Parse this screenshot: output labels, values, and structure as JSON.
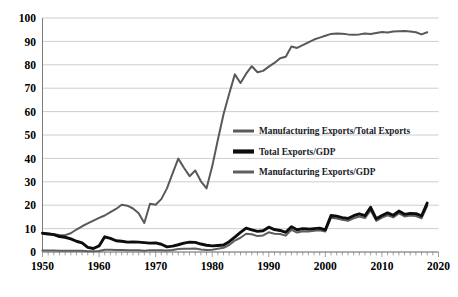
{
  "chart_data": {
    "type": "line",
    "title": "",
    "subtitle": "",
    "xlabel": "",
    "ylabel": "",
    "xlim": [
      1950,
      2020
    ],
    "ylim": [
      0,
      100
    ],
    "grid": true,
    "legend_position": "center-right-inside",
    "y_ticks": [
      0,
      10,
      20,
      30,
      40,
      50,
      60,
      70,
      80,
      90,
      100
    ],
    "y_tick_labels": [
      "0",
      "10",
      "20",
      "30",
      "40",
      "50",
      "60",
      "70",
      "80",
      "90",
      "100"
    ],
    "x_ticks": [
      1950,
      1960,
      1970,
      1980,
      1990,
      2000,
      2010,
      2020
    ],
    "x_tick_labels": [
      "1950",
      "1960",
      "1970",
      "1980",
      "1990",
      "2000",
      "2010",
      "2020"
    ],
    "x_minor_tick_step": 1,
    "colors": {
      "manufacturing_exports_total_exports": "#595959",
      "total_exports_gdp": "#0d0d0d",
      "manufacturing_exports_gdp": "#5e5e5e"
    },
    "x": [
      1950,
      1951,
      1952,
      1953,
      1954,
      1955,
      1956,
      1957,
      1958,
      1959,
      1960,
      1961,
      1962,
      1963,
      1964,
      1965,
      1966,
      1967,
      1968,
      1969,
      1970,
      1971,
      1972,
      1973,
      1974,
      1975,
      1976,
      1977,
      1978,
      1979,
      1980,
      1981,
      1982,
      1983,
      1984,
      1985,
      1986,
      1987,
      1988,
      1989,
      1990,
      1991,
      1992,
      1993,
      1994,
      1995,
      1996,
      1997,
      1998,
      1999,
      2000,
      2001,
      2002,
      2003,
      2004,
      2005,
      2006,
      2007,
      2008,
      2009,
      2010,
      2011,
      2012,
      2013,
      2014,
      2015,
      2016,
      2017,
      2018
    ],
    "series": [
      {
        "name": "Manufacturing Exports/Total Exports",
        "color": "#595959",
        "stroke_width": 2.0,
        "values": [
          8.0,
          7.9,
          7.6,
          7.3,
          7.2,
          8.0,
          9.6,
          11.0,
          12.2,
          13.4,
          14.6,
          15.6,
          17.0,
          18.4,
          20.2,
          19.8,
          18.6,
          16.6,
          12.4,
          20.6,
          20.2,
          22.6,
          27.2,
          33.6,
          39.9,
          36.0,
          32.4,
          34.8,
          30.2,
          27.2,
          36.6,
          48.0,
          58.9,
          67.6,
          75.9,
          72.2,
          76.2,
          79.4,
          76.8,
          77.4,
          79.2,
          80.8,
          82.8,
          83.4,
          87.8,
          87.2,
          88.4,
          89.6,
          90.8,
          91.6,
          92.4,
          93.2,
          93.4,
          93.3,
          93.0,
          92.8,
          93.0,
          93.4,
          93.2,
          93.6,
          94.0,
          93.8,
          94.2,
          94.3,
          94.4,
          94.2,
          93.9,
          93.0,
          93.9
        ]
      },
      {
        "name": "Total Exports/GDP",
        "color": "#0d0d0d",
        "stroke_width": 2.9,
        "values": [
          8.0,
          7.7,
          7.4,
          6.6,
          6.3,
          5.6,
          4.6,
          3.9,
          2.0,
          1.5,
          2.6,
          6.5,
          5.8,
          4.8,
          4.6,
          4.2,
          4.3,
          4.2,
          4.0,
          3.8,
          3.9,
          3.3,
          2.2,
          2.5,
          3.1,
          3.8,
          4.2,
          4.1,
          3.4,
          2.9,
          2.6,
          2.8,
          3.0,
          4.4,
          6.4,
          8.4,
          10.2,
          9.5,
          8.8,
          9.1,
          10.6,
          9.6,
          9.2,
          8.4,
          10.8,
          9.5,
          10.0,
          9.8,
          10.0,
          10.2,
          9.5,
          15.6,
          15.3,
          14.7,
          14.3,
          15.5,
          16.3,
          15.5,
          19.1,
          14.2,
          15.6,
          16.7,
          15.7,
          17.5,
          16.1,
          16.5,
          16.4,
          15.4,
          20.9
        ]
      },
      {
        "name": "Manufacturing Exports/GDP",
        "color": "#5e5e5e",
        "stroke_width": 2.0,
        "values": [
          0.6,
          0.6,
          0.6,
          0.5,
          0.5,
          0.5,
          0.5,
          0.5,
          0.3,
          0.3,
          0.4,
          1.0,
          1.0,
          0.9,
          0.9,
          0.8,
          0.8,
          0.7,
          0.5,
          0.8,
          0.8,
          0.8,
          0.6,
          0.9,
          1.3,
          1.4,
          1.4,
          1.5,
          1.1,
          0.9,
          1.0,
          1.4,
          1.8,
          3.0,
          4.9,
          6.1,
          7.8,
          7.6,
          6.8,
          7.1,
          8.4,
          7.8,
          7.7,
          7.0,
          9.5,
          8.3,
          8.9,
          8.8,
          9.1,
          9.3,
          8.8,
          14.6,
          14.3,
          13.8,
          13.3,
          14.4,
          15.2,
          14.5,
          17.8,
          13.3,
          14.7,
          15.7,
          14.8,
          16.5,
          15.2,
          15.6,
          15.4,
          14.4,
          19.6
        ]
      }
    ],
    "legend": [
      {
        "label": "Manufacturing Exports/Total Exports",
        "color": "#595959",
        "swatch_width": 3.0
      },
      {
        "label": "Total Exports/GDP",
        "color": "#0d0d0d",
        "swatch_width": 4.2
      },
      {
        "label": "Manufacturing Exports/GDP",
        "color": "#5e5e5e",
        "swatch_width": 3.0
      }
    ]
  }
}
